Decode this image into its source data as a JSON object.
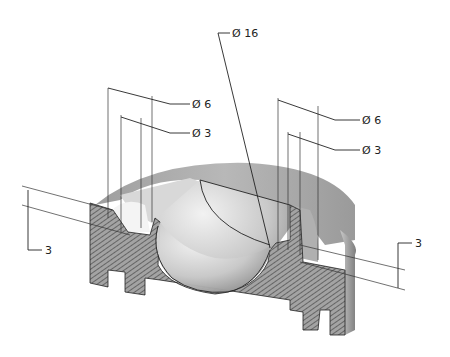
{
  "drawing": {
    "title": "Sectioned isometric view of part with spherical recess",
    "colors": {
      "background": "#ffffff",
      "line": "#222222",
      "hatch_fill": "#9a9a9a",
      "hatch_line": "#333333",
      "surface_light": "#e6e6e6",
      "surface_mid": "#bdbdbd",
      "surface_dark": "#8c8c8c"
    },
    "dimensions": [
      {
        "id": "dia16",
        "label": "Ø 16",
        "target": "spherical recess"
      },
      {
        "id": "dia6_left",
        "label": "Ø 6",
        "target": "left counterbore outer"
      },
      {
        "id": "dia3_left",
        "label": "Ø 3",
        "target": "left counterbore inner"
      },
      {
        "id": "dia6_right",
        "label": "Ø 6",
        "target": "right counterbore outer"
      },
      {
        "id": "dia3_right",
        "label": "Ø 3",
        "target": "right counterbore inner"
      },
      {
        "id": "depth_left",
        "label": "3",
        "target": "left groove depth"
      },
      {
        "id": "depth_right",
        "label": "3",
        "target": "right groove depth"
      }
    ]
  }
}
